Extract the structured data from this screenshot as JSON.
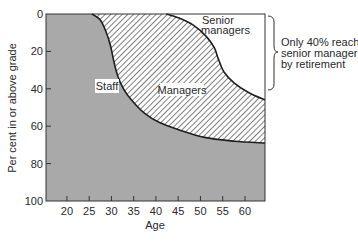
{
  "chart_data": {
    "type": "area",
    "title": "",
    "xlabel": "Age",
    "ylabel": "Per cent in or above grade",
    "xlim": [
      15.3,
      64.5
    ],
    "ylim": [
      0,
      100
    ],
    "y_inverted": true,
    "x_ticks": [
      20,
      25,
      30,
      35,
      40,
      45,
      50,
      55,
      60
    ],
    "y_ticks": [
      0,
      20,
      40,
      60,
      80,
      100
    ],
    "grid": false,
    "legend": null,
    "regions": [
      {
        "name": "Staff",
        "fill": "#a9a9a9",
        "pattern": "solid grey"
      },
      {
        "name": "Managers",
        "fill": "#ffffff",
        "pattern": "diagonal hatch"
      },
      {
        "name": "Senior managers",
        "fill": "#ffffff",
        "pattern": "none"
      }
    ],
    "series": [
      {
        "name": "Staff / Managers boundary",
        "x": [
          15.3,
          25.6,
          27.4,
          28.7,
          29.8,
          30.5,
          31.4,
          32.7,
          34.5,
          37.4,
          40.8,
          45.3,
          50.9,
          57.6,
          64.5
        ],
        "values": [
          0,
          0,
          3,
          9,
          17,
          25,
          33,
          40,
          46,
          53,
          58,
          62,
          66,
          68,
          69
        ]
      },
      {
        "name": "Managers / Senior managers boundary",
        "x": [
          15.3,
          42.3,
          45.0,
          48.4,
          51.3,
          53.1,
          54.0,
          55.3,
          57.6,
          60.8,
          64.5
        ],
        "values": [
          0,
          0,
          2,
          6,
          12,
          18,
          24,
          31,
          37,
          42,
          46
        ]
      }
    ],
    "annotations": [
      {
        "text": "Only 40% reach senior manager by retirement",
        "style": "right curly brace spanning 0–40%"
      }
    ]
  },
  "labels": {
    "staff": "Staff",
    "managers": "Managers",
    "senior_line1": "Senior",
    "senior_line2": "managers",
    "xlabel": "Age",
    "ylabel": "Per cent in or above grade",
    "anno_line1": "Only 40% reach",
    "anno_line2": "senior manager",
    "anno_line3": "by retirement"
  },
  "colors": {
    "staff_fill": "#a9a9a9",
    "line": "#1e1e1e",
    "hatch": "#2a2a2a",
    "background": "#ffffff"
  }
}
